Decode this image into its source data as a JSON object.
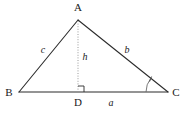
{
  "figure": {
    "type": "geometry-diagram",
    "background_color": "#ffffff",
    "line_color": "#2b2b2b",
    "dotted_line_color": "#8a8a8a",
    "arc_color": "#5a5a5a"
  },
  "vertices": {
    "a": {
      "label": "A",
      "x": 78,
      "y": 20,
      "label_x": 78,
      "label_y": 11
    },
    "b": {
      "label": "B",
      "x": 19,
      "y": 92,
      "label_x": 9,
      "label_y": 96
    },
    "c": {
      "label": "C",
      "x": 168,
      "y": 92,
      "label_x": 176,
      "label_y": 96
    },
    "d": {
      "label": "D",
      "x": 78,
      "y": 92,
      "label_x": 78,
      "label_y": 106
    }
  },
  "sides": {
    "a": {
      "label": "a",
      "label_x": 111,
      "label_y": 106
    },
    "b": {
      "label": "b",
      "label_x": 127,
      "label_y": 53
    },
    "c": {
      "label": "c",
      "label_x": 43,
      "label_y": 53
    },
    "h": {
      "label": "h",
      "label_x": 85,
      "label_y": 60
    }
  },
  "marks": {
    "right_angle": {
      "name": "right-angle-square-at-d",
      "size": 6
    },
    "angle_arc": {
      "name": "angle-arc-at-c",
      "radius": 22,
      "tick": true
    }
  }
}
